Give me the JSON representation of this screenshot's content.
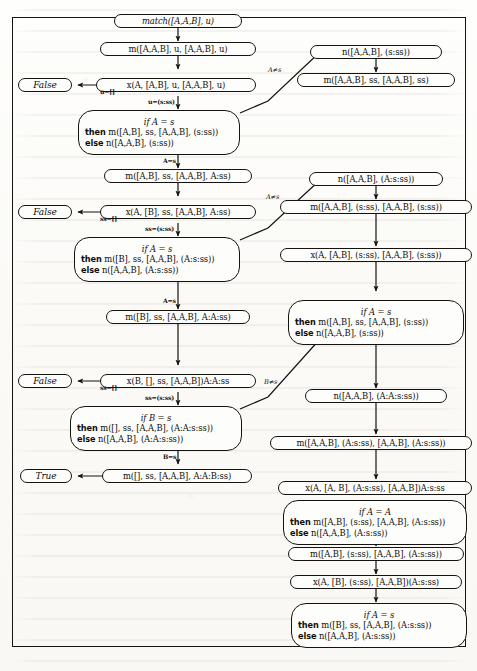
{
  "figure": {
    "kind": "trace-diagram"
  },
  "nodes": {
    "n01": {
      "name": "match-root",
      "shape": "oval",
      "text": "match([A,A,B], u)"
    },
    "n02": {
      "name": "m-call-1",
      "shape": "oval",
      "text": "m([A,A,B], u, [A,A,B], u)"
    },
    "n03": {
      "name": "x-call-1",
      "shape": "oval",
      "text": "x(A, [A,B], u, [A,A,B], u)"
    },
    "n04": {
      "name": "false-1",
      "shape": "terminal",
      "text": "False"
    },
    "n05": {
      "name": "if-block-1",
      "shape": "big",
      "line1": "if A = s",
      "line2_kw": "then",
      "line2": "m([A,B], ss, [A,A,B], (s:ss))",
      "line3_kw": "else",
      "line3": "n([A,A,B], (s:ss))"
    },
    "n06": {
      "name": "m-call-2",
      "shape": "oval",
      "text": "m([A,B], ss, [A,A,B], A:ss)"
    },
    "n07": {
      "name": "x-call-2",
      "shape": "oval",
      "text": "x(A, [B], ss, [A,A,B], A:ss)"
    },
    "n08": {
      "name": "false-2",
      "shape": "terminal",
      "text": "False"
    },
    "n09": {
      "name": "if-block-2",
      "shape": "big",
      "line1": "if A = s",
      "line2_kw": "then",
      "line2": "m([B], ss, [A,A,B], (A:s:ss))",
      "line3_kw": "else",
      "line3": "n([A,A,B], (A:s:ss))"
    },
    "n10": {
      "name": "m-call-3",
      "shape": "oval",
      "text": "m([B], ss, [A,A,B], A:A:ss)"
    },
    "n11": {
      "name": "x-call-3",
      "shape": "oval",
      "text": "x(B, [], ss, [A,A,B])A:A:ss"
    },
    "n12": {
      "name": "false-3",
      "shape": "terminal",
      "text": "False"
    },
    "n13": {
      "name": "if-block-3",
      "shape": "big",
      "line1": "if B = s",
      "line2_kw": "then",
      "line2": "m([], ss, [A,A,B], (A:A:s:ss))",
      "line3_kw": "else",
      "line3": "n([A,A,B], (A:A:s:ss))"
    },
    "n14": {
      "name": "m-call-4",
      "shape": "oval",
      "text": "m([], ss, [A,A,B], A:A:B:ss)"
    },
    "n15": {
      "name": "true-1",
      "shape": "terminal",
      "text": "True"
    },
    "r01": {
      "name": "n-call-1",
      "shape": "oval",
      "text": "n([A,A,B], (s:ss))"
    },
    "r02": {
      "name": "m-call-r1",
      "shape": "oval",
      "text": "m([A,A,B], ss, [A,A,B], ss)"
    },
    "r03": {
      "name": "n-call-2",
      "shape": "oval",
      "text": "n([A,A,B], (A:s:ss))"
    },
    "r04": {
      "name": "m-call-r2",
      "shape": "oval",
      "text": "m([A,A,B], (s:ss), [A,A,B], (s:ss))"
    },
    "r05": {
      "name": "x-call-r1",
      "shape": "oval",
      "text": "x(A, [A,B], (s:ss), [A,A,B], (s:ss))"
    },
    "r06": {
      "name": "if-block-r1",
      "shape": "big",
      "line1": "if A = s",
      "line2_kw": "then",
      "line2": "m([A,B], ss, [A,A,B], (s:ss))",
      "line3_kw": "else",
      "line3": "n([A,A,B], (s:ss))"
    },
    "r07": {
      "name": "n-call-3",
      "shape": "oval",
      "text": "n([A,A,B], (A:A:s:ss))"
    },
    "r08": {
      "name": "m-call-r3",
      "shape": "oval",
      "text": "m([A,A,B], (A:s:ss), [A,A,B], (A:s:ss))"
    },
    "r09": {
      "name": "x-call-r2",
      "shape": "oval",
      "text": "x(A, [A, B], (A:s:ss), [A,A,B])A:s:ss"
    },
    "r10": {
      "name": "if-block-r2",
      "shape": "big",
      "line1": "if A = A",
      "line2_kw": "then",
      "line2": "m([A,B], (s:ss), [A,A,B], (A:s:ss))",
      "line3_kw": "else",
      "line3": "n([A,A,B], (A:s:ss))"
    },
    "r11": {
      "name": "m-call-r4",
      "shape": "oval",
      "text": "m([A,B], (s:ss), [A,A,B], (A:s:ss))"
    },
    "r12": {
      "name": "x-call-r3",
      "shape": "oval",
      "text": "x(A, [B], (s:ss), [A,A,B])(A:s:ss)"
    },
    "r13": {
      "name": "if-block-r3",
      "shape": "big",
      "line1": "if A = s",
      "line2_kw": "then",
      "line2": "m([B], ss, [A,A,B], (A:s:ss))",
      "line3_kw": "else",
      "line3": "n([A,A,B], (A:s:ss))"
    }
  },
  "edge_labels": {
    "e1": "u=[]",
    "e2": "u=(s:ss)",
    "e3": "A≠s",
    "e4": "A=s",
    "e5": "ss=[]",
    "e6": "ss=(s:ss)",
    "e7": "A≠s",
    "e8": "A=s",
    "e9": "ss=[]",
    "e10": "ss=(s:ss)",
    "e11": "B≠s",
    "e12": "B=s"
  },
  "colors": {
    "ink": "#15130f",
    "paper": "#fdfdfb"
  }
}
